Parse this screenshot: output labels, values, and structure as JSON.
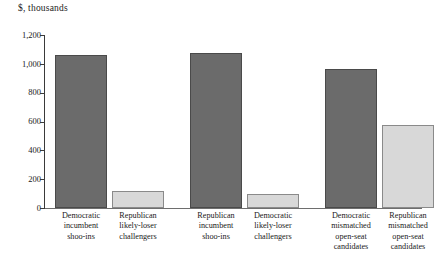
{
  "chart_data": {
    "type": "bar",
    "title": "$, thousands",
    "xlabel": "",
    "ylabel": "$, thousands",
    "ylim": [
      0,
      1200
    ],
    "yticks": [
      "0",
      "200",
      "400",
      "600",
      "800",
      "1,000",
      "1,200"
    ],
    "ytick_values": [
      0,
      200,
      400,
      600,
      800,
      1000,
      1200
    ],
    "grid": false,
    "legend": "none",
    "categories": [
      "Democratic incumbent shoo-ins",
      "Republican likely-loser challengers",
      "Republican incumbent shoo-ins",
      "Democratic likely-loser challengers",
      "Democratic mismatched open-seat candidates",
      "Republican mismatched open-seat candidates"
    ],
    "values": [
      1060,
      115,
      1075,
      100,
      965,
      575
    ],
    "bar_colors": [
      "dark",
      "light",
      "dark",
      "light",
      "dark",
      "light"
    ],
    "colors": {
      "dark": "#6b6b6b",
      "light": "#d8d8d8",
      "axis": "#3a3a3a",
      "background": "#ffffff"
    }
  },
  "labels": {
    "cat0_lines": [
      "Democratic",
      "incumbent",
      "shoo-ins"
    ],
    "cat1_lines": [
      "Republican",
      "likely-loser",
      "challengers"
    ],
    "cat2_lines": [
      "Republican",
      "incumbent",
      "shoo-ins"
    ],
    "cat3_lines": [
      "Democratic",
      "likely-loser",
      "challengers"
    ],
    "cat4_lines": [
      "Democratic",
      "mismatched",
      "open-seat",
      "candidates"
    ],
    "cat5_lines": [
      "Republican",
      "mismatched",
      "open-seat",
      "candidates"
    ]
  }
}
